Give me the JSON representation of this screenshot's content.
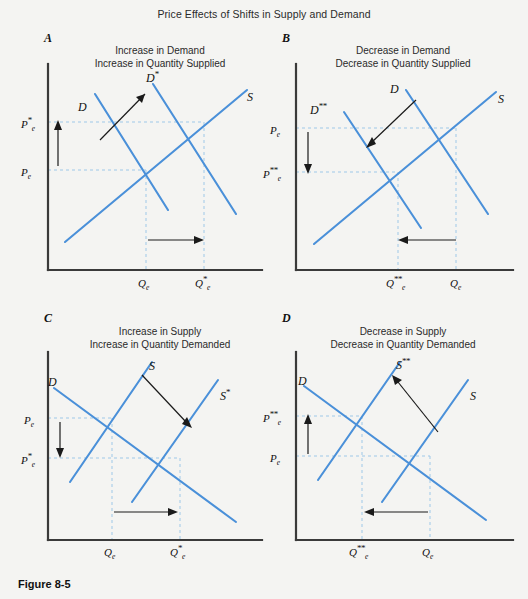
{
  "figure": {
    "title": "Price Effects of Shifts in Supply and Demand",
    "caption": "Figure 8-5",
    "curve_color": "#4a90d9",
    "axis_color": "#3a3a3a",
    "guide_color": "#9ec8e8",
    "arrow_color": "#1a1a1a",
    "background": "#f4f4f2"
  },
  "panels": [
    {
      "letter": "A",
      "heading_line1": "Increase in Demand",
      "heading_line2": "Increase in Quantity Supplied",
      "curves": [
        {
          "name": "demand-original",
          "label": "D",
          "label_sup": ""
        },
        {
          "name": "demand-shifted",
          "label": "D",
          "label_sup": "*"
        },
        {
          "name": "supply",
          "label": "S",
          "label_sup": ""
        }
      ],
      "price_labels": [
        {
          "name": "price-new",
          "base": "P",
          "sup": "*",
          "sub": "e"
        },
        {
          "name": "price-original",
          "base": "P",
          "sup": "",
          "sub": "e"
        }
      ],
      "quantity_labels": [
        {
          "name": "quantity-original",
          "base": "Q",
          "sup": "",
          "sub": "e"
        },
        {
          "name": "quantity-new",
          "base": "Q",
          "sup": "*",
          "sub": "e"
        }
      ],
      "price_arrow_direction": "up",
      "quantity_arrow_direction": "right",
      "shift_arrow_direction": "up-right"
    },
    {
      "letter": "B",
      "heading_line1": "Decrease in Demand",
      "heading_line2": "Decrease in Quantity Supplied",
      "curves": [
        {
          "name": "demand-original",
          "label": "D",
          "label_sup": ""
        },
        {
          "name": "demand-shifted",
          "label": "D",
          "label_sup": "**"
        },
        {
          "name": "supply",
          "label": "S",
          "label_sup": ""
        }
      ],
      "price_labels": [
        {
          "name": "price-original",
          "base": "P",
          "sup": "",
          "sub": "e"
        },
        {
          "name": "price-new",
          "base": "P",
          "sup": "**",
          "sub": "e"
        }
      ],
      "quantity_labels": [
        {
          "name": "quantity-new",
          "base": "Q",
          "sup": "**",
          "sub": "e"
        },
        {
          "name": "quantity-original",
          "base": "Q",
          "sup": "",
          "sub": "e"
        }
      ],
      "price_arrow_direction": "down",
      "quantity_arrow_direction": "left",
      "shift_arrow_direction": "down-left"
    },
    {
      "letter": "C",
      "heading_line1": "Increase in Supply",
      "heading_line2": "Increase in Quantity Demanded",
      "curves": [
        {
          "name": "demand",
          "label": "D",
          "label_sup": ""
        },
        {
          "name": "supply-original",
          "label": "S",
          "label_sup": ""
        },
        {
          "name": "supply-shifted",
          "label": "S",
          "label_sup": "*"
        }
      ],
      "price_labels": [
        {
          "name": "price-original",
          "base": "P",
          "sup": "",
          "sub": "e"
        },
        {
          "name": "price-new",
          "base": "P",
          "sup": "*",
          "sub": "e"
        }
      ],
      "quantity_labels": [
        {
          "name": "quantity-original",
          "base": "Q",
          "sup": "",
          "sub": "e"
        },
        {
          "name": "quantity-new",
          "base": "Q",
          "sup": "*",
          "sub": "e"
        }
      ],
      "price_arrow_direction": "down",
      "quantity_arrow_direction": "right",
      "shift_arrow_direction": "down-right"
    },
    {
      "letter": "D",
      "heading_line1": "Decrease in Supply",
      "heading_line2": "Decrease in Quantity Demanded",
      "curves": [
        {
          "name": "demand",
          "label": "D",
          "label_sup": ""
        },
        {
          "name": "supply-shifted",
          "label": "S",
          "label_sup": "**"
        },
        {
          "name": "supply-original",
          "label": "S",
          "label_sup": ""
        }
      ],
      "price_labels": [
        {
          "name": "price-new",
          "base": "P",
          "sup": "**",
          "sub": "e"
        },
        {
          "name": "price-original",
          "base": "P",
          "sup": "",
          "sub": "e"
        }
      ],
      "quantity_labels": [
        {
          "name": "quantity-new",
          "base": "Q",
          "sup": "**",
          "sub": "e"
        },
        {
          "name": "quantity-original",
          "base": "Q",
          "sup": "",
          "sub": "e"
        }
      ],
      "price_arrow_direction": "up",
      "quantity_arrow_direction": "left",
      "shift_arrow_direction": "up-right"
    }
  ]
}
